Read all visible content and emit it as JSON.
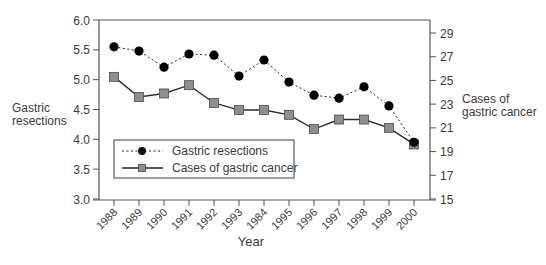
{
  "chart_data": {
    "type": "line",
    "title": "",
    "xlabel": "Year",
    "ylabel": "Gastric resections",
    "y2label": "Cases of gastric cancer",
    "categories": [
      "1988",
      "1989",
      "1990",
      "1991",
      "1992",
      "1993",
      "1984",
      "1995",
      "1996",
      "1997",
      "1998",
      "1999",
      "2000"
    ],
    "ylim": [
      3.0,
      6.0
    ],
    "yticks": [
      "3.0",
      "3.5",
      "4.0",
      "4.5",
      "5.0",
      "5.5",
      "6.0"
    ],
    "y2lim": [
      15,
      30
    ],
    "y2ticks": [
      "15",
      "17",
      "19",
      "21",
      "23",
      "25",
      "27",
      "29"
    ],
    "grid": false,
    "legend_position": "lower left, inside plot",
    "series": [
      {
        "name": "Gastric resections",
        "axis": "left",
        "line_style": "dotted",
        "marker": "circle",
        "color": "#000000",
        "values": [
          5.55,
          5.48,
          5.21,
          5.43,
          5.41,
          5.06,
          5.33,
          4.96,
          4.74,
          4.69,
          4.88,
          4.56,
          3.95
        ]
      },
      {
        "name": "Cases of gastric cancer",
        "axis": "right",
        "line_style": "solid",
        "marker": "square",
        "color": "#2b2b2b",
        "marker_fill": "#8e8e8e",
        "values": [
          25.3,
          23.6,
          23.9,
          24.6,
          23.1,
          22.5,
          22.5,
          22.1,
          20.9,
          21.7,
          21.7,
          21.0,
          19.6
        ]
      }
    ]
  },
  "labels": {
    "left_axis_line1": "Gastric",
    "left_axis_line2": "resections",
    "right_axis_line1": "Cases of",
    "right_axis_line2": "gastric cancer",
    "x_axis": "Year"
  },
  "legend": {
    "items": [
      {
        "label": "Gastric resections"
      },
      {
        "label": "Cases of gastric cancer"
      }
    ]
  }
}
